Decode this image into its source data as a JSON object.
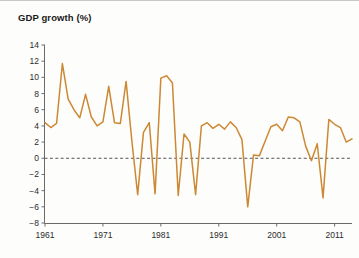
{
  "chart_data": {
    "type": "line",
    "title": "GDP growth (%)",
    "xlabel": "",
    "ylabel": "",
    "ylim": [
      -8,
      14
    ],
    "xlim": [
      1961,
      2014
    ],
    "grid": false,
    "legend": null,
    "zero_line": 0,
    "line_color": "#cc8833",
    "y_ticks": [
      14,
      12,
      10,
      8,
      6,
      4,
      2,
      0,
      -2,
      -4,
      -6,
      -8
    ],
    "y_tick_labels": [
      "14",
      "12",
      "10",
      "8",
      "6",
      "4",
      "2",
      "0",
      "−2",
      "−4",
      "−6",
      "−8"
    ],
    "x_ticks": [
      1961,
      1971,
      1981,
      1991,
      2001,
      2011
    ],
    "x_tick_labels": [
      "1961",
      "1971",
      "1981",
      "1991",
      "2001",
      "2011"
    ],
    "x": [
      1961,
      1962,
      1963,
      1964,
      1965,
      1966,
      1967,
      1968,
      1969,
      1970,
      1971,
      1972,
      1973,
      1974,
      1975,
      1976,
      1977,
      1978,
      1979,
      1980,
      1981,
      1982,
      1983,
      1984,
      1985,
      1986,
      1987,
      1988,
      1989,
      1990,
      1991,
      1992,
      1993,
      1994,
      1995,
      1996,
      1997,
      1998,
      1999,
      2000,
      2001,
      2002,
      2003,
      2004,
      2005,
      2006,
      2007,
      2008,
      2009,
      2010,
      2011,
      2012,
      2013,
      2014
    ],
    "values": [
      4.4,
      3.8,
      4.3,
      11.7,
      7.3,
      6.0,
      5.0,
      7.9,
      5.1,
      4.0,
      4.5,
      8.9,
      4.4,
      4.3,
      9.5,
      2.1,
      -4.5,
      3.2,
      4.4,
      -4.4,
      9.9,
      10.2,
      9.3,
      -4.6,
      3.0,
      2.0,
      -4.5,
      4.0,
      4.4,
      3.7,
      4.2,
      3.6,
      4.5,
      3.8,
      2.3,
      -6.0,
      0.4,
      0.3,
      2.1,
      3.9,
      4.2,
      3.4,
      5.1,
      5.0,
      4.5,
      1.5,
      -0.3,
      1.8,
      -4.9,
      4.8,
      4.2,
      3.8,
      2.0,
      2.4
    ],
    "series_name": "GDP growth"
  },
  "axis": {
    "axis_color": "#6b6b6b",
    "zero_line_color": "#555555"
  }
}
